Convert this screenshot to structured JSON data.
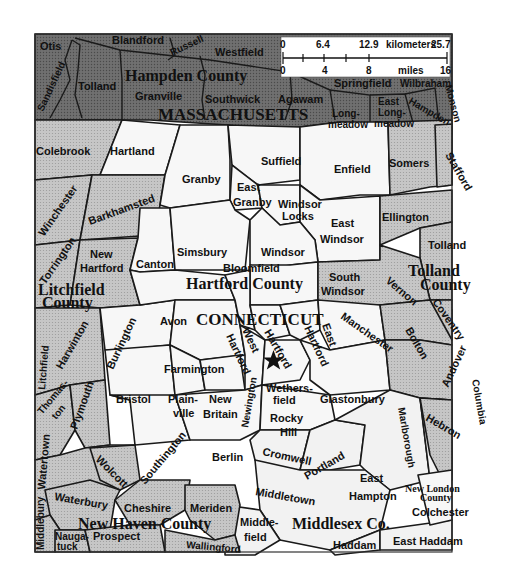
{
  "map": {
    "states": {
      "massachusetts": "MASSACHUSETTS",
      "connecticut": "CONNECTICUT"
    },
    "counties": {
      "hampden": "Hampden County",
      "hartford": "Hartford County",
      "litchfield_1": "Litchfield",
      "litchfield_2": "County",
      "tolland_1": "Tolland",
      "tolland_2": "County",
      "new_haven": "New Haven County",
      "middlesex": "Middlesex Co.",
      "new_london_1": "New London",
      "new_london_2": "County"
    },
    "towns": {
      "otis": "Otis",
      "blandford": "Blandford",
      "russell": "Russell",
      "westfield": "Westfield",
      "tolland_ma": "Tolland",
      "granville": "Granville",
      "southwick": "Southwick",
      "agawam": "Agawam",
      "springfield": "Springfield",
      "wilbraham": "Wilbraham",
      "hampden": "Hampden",
      "monson": "Monson",
      "longmeadow_1": "Long-",
      "longmeadow_2": "meadow",
      "east_longmeadow_1": "East",
      "east_longmeadow_2": "Long-",
      "east_longmeadow_3": "meadow",
      "sandisfield": "Sandisfield",
      "colebrook": "Colebrook",
      "hartland": "Hartland",
      "granby": "Granby",
      "suffield": "Suffield",
      "enfield": "Enfield",
      "somers": "Somers",
      "stafford": "Stafford",
      "winchester": "Winchester",
      "barkhamsted": "Barkhamsted",
      "east_granby_1": "East",
      "east_granby_2": "Granby",
      "windsor_locks_1": "Windsor",
      "windsor_locks_2": "Locks",
      "east_windsor_1": "East",
      "east_windsor_2": "Windsor",
      "ellington": "Ellington",
      "tolland_ct": "Tolland",
      "torrington": "Torrington",
      "new_hartford_1": "New",
      "new_hartford_2": "Hartford",
      "canton": "Canton",
      "simsbury": "Simsbury",
      "windsor": "Windsor",
      "bloomfield": "Bloomfield",
      "south_windsor_1": "South",
      "south_windsor_2": "Windsor",
      "vernon": "Vernon",
      "harwinton": "Harwinton",
      "burlington": "Burlington",
      "avon": "Avon",
      "west_hartford_1": "West",
      "west_hartford_2": "Hartford",
      "hartford": "Hartford",
      "east_hartford_1": "East",
      "east_hartford_2": "Hartford",
      "manchester": "Manchester",
      "bolton": "Bolton",
      "coventry": "Coventry",
      "andover": "Andover",
      "columbia": "Columbia",
      "litchfield_town": "Litchfield",
      "thomaston_1": "Thomas-",
      "thomaston_2": "ton",
      "plymouth": "Plymouth",
      "bristol": "Bristol",
      "farmington": "Farmington",
      "plainville_1": "Plain-",
      "plainville_2": "ville",
      "new_britain_1": "New",
      "new_britain_2": "Britain",
      "newington": "Newington",
      "wethersfield_1": "Wethers-",
      "wethersfield_2": "field",
      "glastonbury": "Glastonbury",
      "rocky_hill_1": "Rocky",
      "rocky_hill_2": "Hill",
      "marlborough": "Marlborough",
      "hebron": "Hebron",
      "watertown": "Watertown",
      "wolcott": "Wolcott",
      "southington": "Southington",
      "berlin": "Berlin",
      "cromwell": "Cromwell",
      "portland": "Portland",
      "east_hampton_1": "East",
      "east_hampton_2": "Hampton",
      "waterbury": "Waterbury",
      "cheshire": "Cheshire",
      "meriden": "Meriden",
      "middletown": "Middletown",
      "colchester": "Colchester",
      "middlebury": "Middlebury",
      "naugatuck_1": "Nauga-",
      "naugatuck_2": "tuck",
      "prospect": "Prospect",
      "wallingford": "Wallingford",
      "middlefield_1": "Middle-",
      "middlefield_2": "field",
      "haddam": "Haddam",
      "east_haddam": "East Haddam"
    },
    "capital_marker": "star-icon",
    "scale_bar": {
      "km_ticks": [
        "0",
        "6.4",
        "12.9",
        "25.7"
      ],
      "km_unit": "kilometers",
      "mile_ticks": [
        "0",
        "4",
        "8",
        "16"
      ],
      "mile_unit": "miles"
    },
    "fill_colors": {
      "massachusetts": "#6c6c6c",
      "shaded_county": "#c9c9c9",
      "hartford_county": "#f7f7f7",
      "border": "#1a1a1a"
    }
  }
}
